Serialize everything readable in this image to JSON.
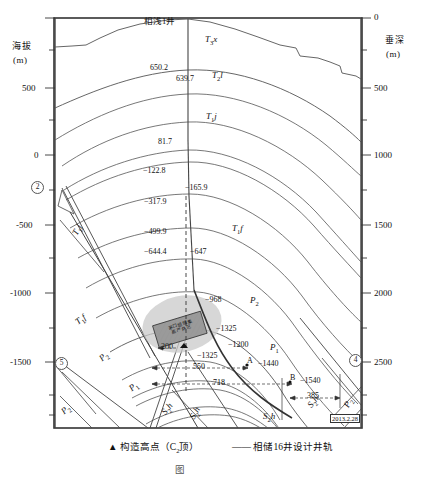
{
  "figure": {
    "caption": "图",
    "date_stamp": "2013.2.28"
  },
  "axes": {
    "left": {
      "title": "海拔",
      "unit": "(m)",
      "ticks": [
        "",
        "500",
        "0",
        "-500",
        "-1000",
        "-1500"
      ]
    },
    "right": {
      "title": "垂深",
      "unit": "(m)",
      "ticks": [
        "0",
        "500",
        "1000",
        "1500",
        "2000",
        "2500"
      ]
    }
  },
  "wells": {
    "shallow_well_label": "相浅1井",
    "design_well_label": "相储16井设计井轨"
  },
  "formations": [
    {
      "id": "t3x",
      "base": "T",
      "sub": "3",
      "suffix": "x"
    },
    {
      "id": "t2l",
      "base": "T",
      "sub": "2",
      "suffix": "l"
    },
    {
      "id": "t1j_top",
      "base": "T",
      "sub": "1",
      "suffix": "j"
    },
    {
      "id": "t1j_left",
      "base": "T",
      "sub": "1",
      "suffix": "j"
    },
    {
      "id": "t1f",
      "base": "T",
      "sub": "1",
      "suffix": "f"
    },
    {
      "id": "t1f_left",
      "base": "T",
      "sub": "1",
      "suffix": "f"
    },
    {
      "id": "p2",
      "base": "P",
      "sub": "2",
      "suffix": ""
    },
    {
      "id": "p1",
      "base": "P",
      "sub": "1",
      "suffix": ""
    },
    {
      "id": "p2_l",
      "base": "P",
      "sub": "2",
      "suffix": ""
    },
    {
      "id": "p1_l",
      "base": "P",
      "sub": "1",
      "suffix": ""
    },
    {
      "id": "p2_bl",
      "base": "P",
      "sub": "2",
      "suffix": ""
    },
    {
      "id": "p2_br",
      "base": "P",
      "sub": "2",
      "suffix": ""
    },
    {
      "id": "s2h",
      "base": "S",
      "sub": "2",
      "suffix": "h"
    },
    {
      "id": "s2h_l",
      "base": "S",
      "sub": "2",
      "suffix": "h"
    },
    {
      "id": "s2h_r",
      "base": "S",
      "sub": "2",
      "suffix": "h"
    }
  ],
  "depth_values": {
    "v650_2": "650.2",
    "v639_7": "639.7",
    "v81_7": "81.7",
    "v122_8": "−122.8",
    "v165_9": "−165.9",
    "v317_9": "−317.9",
    "v499_9": "−499.9",
    "v644_4": "−644.4",
    "v647": "−647",
    "v968": "−968",
    "v1325": "−1325",
    "v1200": "−1200",
    "v1325b": "−1325",
    "v1440": "−1440",
    "v1540": "−1540"
  },
  "dimensions": {
    "d200": "200",
    "d550": "550",
    "d718": "718",
    "d385": "385"
  },
  "markers": {
    "a": "A",
    "b": "B",
    "triangle": "▲"
  },
  "fault_numbers": [
    "2",
    "5",
    "4"
  ],
  "reservoir_box": {
    "line1": "茅口组储集",
    "line2": "高产井区"
  },
  "legend": {
    "symbol_triangle": "▲",
    "item1": "构造高点（C",
    "item1_sub": "2",
    "item1_end": "顶）",
    "symbol_line": "——",
    "item2": "相储16井设计井轨"
  }
}
